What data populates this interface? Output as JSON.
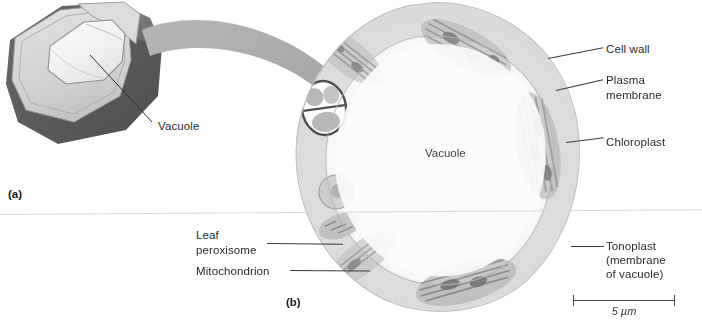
{
  "figure": {
    "panels": [
      {
        "tag": "(a)",
        "kind": "illustration"
      },
      {
        "tag": "(b)",
        "kind": "electron-micrograph"
      }
    ]
  },
  "panel_a": {
    "tag": "(a)",
    "labels": [
      {
        "name": "vacuole",
        "text": "Vacuole"
      }
    ]
  },
  "panel_b": {
    "tag": "(b)",
    "center_label": "Vacuole",
    "labels_right": [
      {
        "name": "cell-wall",
        "text": "Cell wall"
      },
      {
        "name": "plasma-membrane",
        "line1": "Plasma",
        "line2": "membrane"
      },
      {
        "name": "chloroplast",
        "text": "Chloroplast"
      },
      {
        "name": "tonoplast",
        "line1": "Tonoplast",
        "line2": "(membrane",
        "line3": "of vacuole)"
      }
    ],
    "labels_left": [
      {
        "name": "leaf-peroxisome",
        "line1": "Leaf",
        "line2": "peroxisome"
      },
      {
        "name": "mitochondrion",
        "line1": "Mitochondrion"
      }
    ],
    "scale_bar": {
      "label": "5 µm",
      "length_px": 102
    }
  },
  "colors": {
    "cell_wall_dark": "#575757",
    "cell_wall_mid": "#7d7d7d",
    "cut_face_light": "#d6d6d6",
    "vacuole_pale": "#f2f2f2",
    "arrow_gray": "#a9a9a9",
    "leader_line": "#3a3a3a",
    "text": "#2b2b2b",
    "separator": "#d9d9d9",
    "micrograph_ink": "#9a9a9a"
  }
}
